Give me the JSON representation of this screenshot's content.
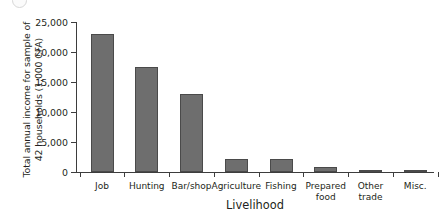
{
  "chart_data": {
    "type": "bar",
    "title": "",
    "categories": [
      "Job",
      "Hunting",
      "Bar/shop",
      "Agriculture",
      "Fishing",
      "Prepared food",
      "Other trade",
      "Misc."
    ],
    "values": [
      23000,
      17500,
      13000,
      2200,
      2100,
      900,
      400,
      350
    ],
    "xlabel": "Livelihood",
    "ylabel": "Total annual income for sample of\n42 households (1,000 CFA)",
    "ylim": [
      0,
      25000
    ],
    "ytick_values": [
      0,
      5000,
      10000,
      15000,
      20000,
      25000
    ],
    "ytick_labels": [
      "0",
      "5,000",
      "10,000",
      "15,000",
      "20,000",
      "25,000"
    ],
    "grid": false,
    "legend": false,
    "bar_color": "#6e6e6e",
    "bar_edge_color": "#4a4a4a",
    "axis_color": "#3d3d3d"
  },
  "axes": {
    "y_title": "Total annual income for sample of\n42 households (1,000 CFA)",
    "x_title": "Livelihood"
  },
  "ticks": {
    "y": [
      {
        "label": "25,000",
        "value": 25000
      },
      {
        "label": "20,000",
        "value": 20000
      },
      {
        "label": "15,000",
        "value": 15000
      },
      {
        "label": "10,000",
        "value": 10000
      },
      {
        "label": "5,000",
        "value": 5000
      },
      {
        "label": "0",
        "value": 0
      }
    ],
    "x": [
      {
        "label": "Job",
        "value": 23000
      },
      {
        "label": "Hunting",
        "value": 17500
      },
      {
        "label": "Bar/shop",
        "value": 13000
      },
      {
        "label": "Agriculture",
        "value": 2200
      },
      {
        "label": "Fishing",
        "value": 2100
      },
      {
        "label": "Prepared\nfood",
        "value": 900
      },
      {
        "label": "Other\ntrade",
        "value": 400
      },
      {
        "label": "Misc.",
        "value": 350
      }
    ]
  }
}
